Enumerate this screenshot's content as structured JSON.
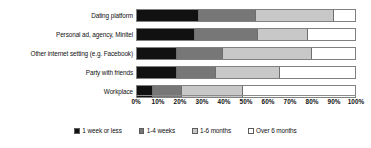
{
  "chart_data": {
    "type": "bar",
    "orientation": "horizontal",
    "stacked": true,
    "normalized": true,
    "title": "",
    "xlabel": "",
    "ylabel": "",
    "xlim": [
      0,
      100
    ],
    "grid": false,
    "legend_position": "bottom",
    "categories": [
      "Dating platform",
      "Personal ad, agency, Minitel",
      "Other internet setting (e.g. Facebook)",
      "Party with friends",
      "Workplace"
    ],
    "series": [
      {
        "name": "1 week or less",
        "color": "#111111",
        "values": [
          28,
          26,
          18,
          18,
          7
        ]
      },
      {
        "name": "1-4 weeks",
        "color": "#777777",
        "values": [
          26,
          29,
          21,
          18,
          13
        ]
      },
      {
        "name": "1-6 months",
        "color": "#c8c8c8",
        "values": [
          36,
          23,
          41,
          29,
          28
        ]
      },
      {
        "name": "Over 6 months",
        "color": "#ffffff",
        "values": [
          10,
          22,
          20,
          35,
          52
        ]
      }
    ],
    "xticks": [
      {
        "value": 0,
        "label": "0%"
      },
      {
        "value": 10,
        "label": "10%"
      },
      {
        "value": 20,
        "label": "20%"
      },
      {
        "value": 30,
        "label": "30%"
      },
      {
        "value": 40,
        "label": "40%"
      },
      {
        "value": 50,
        "label": "50%"
      },
      {
        "value": 60,
        "label": "60%"
      },
      {
        "value": 70,
        "label": "70%"
      },
      {
        "value": 80,
        "label": "80%"
      },
      {
        "value": 90,
        "label": "90%"
      },
      {
        "value": 100,
        "label": "100%"
      }
    ]
  }
}
